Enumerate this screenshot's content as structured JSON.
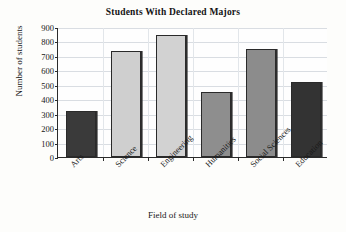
{
  "chart_data": {
    "type": "bar",
    "title": "Students With Declared Majors",
    "xlabel": "Field of study",
    "ylabel": "Number of students",
    "categories": [
      "Arts",
      "Science",
      "Engineering",
      "Humanities",
      "Social Sciences",
      "Education"
    ],
    "values": [
      320,
      735,
      845,
      450,
      750,
      520
    ],
    "ylim": [
      0,
      900
    ],
    "ytick_labels": [
      "900",
      "800",
      "700",
      "600",
      "500",
      "400",
      "300",
      "200",
      "100",
      "0"
    ],
    "ytick_values": [
      900,
      800,
      700,
      600,
      500,
      400,
      300,
      200,
      100,
      0
    ],
    "ytick_step": 100,
    "grid": true,
    "legend": "none",
    "bar_colors": [
      "#3a3a3a",
      "#cfcfcf",
      "#d2d2d2",
      "#8e8e8e",
      "#8c8c8c",
      "#333333"
    ],
    "bar_border_color": "#2a2a2a",
    "axis_color": "#2b2b2b",
    "gridline_color": "#d9dde2",
    "background_color": "#fdfdfb"
  }
}
